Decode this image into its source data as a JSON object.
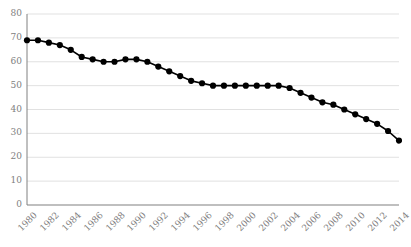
{
  "chart_data": {
    "type": "line",
    "title": "",
    "subtitle": "",
    "xlabel": "",
    "ylabel": "",
    "grid": true,
    "legend": false,
    "marker": "filled-circle",
    "line_color": "#000000",
    "marker_color": "#000000",
    "grid_color": "#d9d9d9",
    "axis_color": "#808080",
    "tick_label_color": "#808080",
    "ylim": [
      0,
      80
    ],
    "yticks": [
      0,
      10,
      20,
      30,
      40,
      50,
      60,
      70,
      80
    ],
    "ytick_labels": [
      "0",
      "10",
      "20",
      "30",
      "40",
      "50",
      "60",
      "70",
      "80"
    ],
    "xlim": [
      1980,
      2014
    ],
    "xtick_labels": [
      "1980",
      "1982",
      "1984",
      "1986",
      "1988",
      "1990",
      "1992",
      "1994",
      "1996",
      "1998",
      "2000",
      "2002",
      "2004",
      "2006",
      "2008",
      "2010",
      "2012",
      "2014"
    ],
    "xtick_values": [
      1980,
      1982,
      1984,
      1986,
      1988,
      1990,
      1992,
      1994,
      1996,
      1998,
      2000,
      2002,
      2004,
      2006,
      2008,
      2010,
      2012,
      2014
    ],
    "x": [
      1980,
      1981,
      1982,
      1983,
      1984,
      1985,
      1986,
      1987,
      1988,
      1989,
      1990,
      1991,
      1992,
      1993,
      1994,
      1995,
      1996,
      1997,
      1998,
      1999,
      2000,
      2001,
      2002,
      2003,
      2004,
      2005,
      2006,
      2007,
      2008,
      2009,
      2010,
      2011,
      2012,
      2013,
      2014
    ],
    "values": [
      69,
      69,
      68,
      67,
      65,
      62,
      61,
      60,
      60,
      61,
      61,
      60,
      58,
      56,
      54,
      52,
      51,
      50,
      50,
      50,
      50,
      50,
      50,
      50,
      49,
      47,
      45,
      43,
      42,
      40,
      38,
      36,
      34,
      31,
      27
    ]
  }
}
